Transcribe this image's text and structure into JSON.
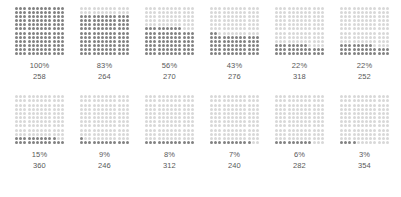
{
  "chart_data": {
    "type": "waffle",
    "title": "",
    "xlabel": "",
    "ylabel": "",
    "grid_rows": 12,
    "grid_cols": 12,
    "total_cells": 144,
    "fill_order": "bottom-up-left-to-right",
    "colors": {
      "filled": "#828282",
      "empty": "#d8d8d8",
      "background": "#ffffff",
      "label": "#595959"
    },
    "categories": [
      "100%",
      "83%",
      "56%",
      "43%",
      "22%",
      "22%",
      "15%",
      "9%",
      "8%",
      "7%",
      "6%",
      "3%"
    ],
    "values": [
      100,
      83,
      56,
      43,
      22,
      22,
      15,
      9,
      8,
      7,
      6,
      3
    ],
    "counts": [
      258,
      264,
      270,
      276,
      318,
      252,
      360,
      246,
      312,
      240,
      282,
      354
    ],
    "series": [
      {
        "name": "percent",
        "values": [
          100,
          83,
          56,
          43,
          22,
          22,
          15,
          9,
          8,
          7,
          6,
          3
        ]
      },
      {
        "name": "count",
        "values": [
          258,
          264,
          270,
          276,
          318,
          252,
          360,
          246,
          312,
          240,
          282,
          354
        ]
      }
    ]
  },
  "panels": {
    "row1": [
      {
        "percent_label": "100%",
        "count_label": "258",
        "percent": 100
      },
      {
        "percent_label": "83%",
        "count_label": "264",
        "percent": 83
      },
      {
        "percent_label": "56%",
        "count_label": "270",
        "percent": 56
      },
      {
        "percent_label": "43%",
        "count_label": "276",
        "percent": 43
      },
      {
        "percent_label": "22%",
        "count_label": "318",
        "percent": 22
      },
      {
        "percent_label": "22%",
        "count_label": "252",
        "percent": 22
      }
    ],
    "row2": [
      {
        "percent_label": "15%",
        "count_label": "360",
        "percent": 15
      },
      {
        "percent_label": "9%",
        "count_label": "246",
        "percent": 9
      },
      {
        "percent_label": "8%",
        "count_label": "312",
        "percent": 8
      },
      {
        "percent_label": "7%",
        "count_label": "240",
        "percent": 7
      },
      {
        "percent_label": "6%",
        "count_label": "282",
        "percent": 6
      },
      {
        "percent_label": "3%",
        "count_label": "354",
        "percent": 3
      }
    ]
  },
  "caption": {
    "text": ""
  }
}
